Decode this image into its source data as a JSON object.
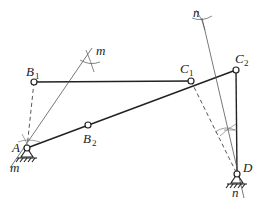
{
  "diagram": {
    "type": "four-bar linkage graphical synthesis",
    "colors": {
      "ink": "#222222",
      "construction": "#555555",
      "background": "#ffffff"
    },
    "points": {
      "A": {
        "x": 27,
        "y": 148,
        "label": "A",
        "sub": ""
      },
      "B1": {
        "x": 34,
        "y": 82,
        "label": "B",
        "sub": "1"
      },
      "B2": {
        "x": 88,
        "y": 125,
        "label": "B",
        "sub": "2"
      },
      "C1": {
        "x": 191,
        "y": 81,
        "label": "C",
        "sub": "1"
      },
      "C2": {
        "x": 236,
        "y": 70,
        "label": "C",
        "sub": "2"
      },
      "D": {
        "x": 237,
        "y": 174,
        "label": "D",
        "sub": ""
      }
    },
    "bisectors": {
      "m": {
        "label": "m",
        "label_top": "m",
        "label_bottom": "m"
      },
      "n": {
        "label": "n",
        "label_top": "n",
        "label_bottom": "n"
      }
    },
    "labels": {
      "A": "A",
      "B1_main": "B",
      "B1_sub": "1",
      "B2_main": "B",
      "B2_sub": "2",
      "C1_main": "C",
      "C1_sub": "1",
      "C2_main": "C",
      "C2_sub": "2",
      "D": "D",
      "m_top": "m",
      "m_bottom": "m",
      "n_top": "n",
      "n_bottom": "n"
    }
  }
}
